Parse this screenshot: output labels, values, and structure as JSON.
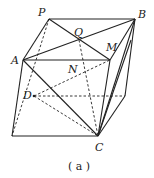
{
  "diagram": {
    "caption": "( a )",
    "labels": {
      "P": "P",
      "Q": "Q",
      "B": "B",
      "A": "A",
      "M": "M",
      "N": "N",
      "D": "D",
      "C": "C"
    },
    "points": {
      "P": [
        49,
        19
      ],
      "B": [
        135,
        19
      ],
      "A": [
        23,
        60
      ],
      "M": [
        110,
        60
      ],
      "Q": [
        79,
        40
      ],
      "D": [
        34,
        96
      ],
      "E": [
        125,
        96
      ],
      "C": [
        98,
        136
      ],
      "F": [
        12,
        136
      ],
      "N": [
        80,
        74
      ],
      "G": [
        131,
        60
      ]
    }
  }
}
